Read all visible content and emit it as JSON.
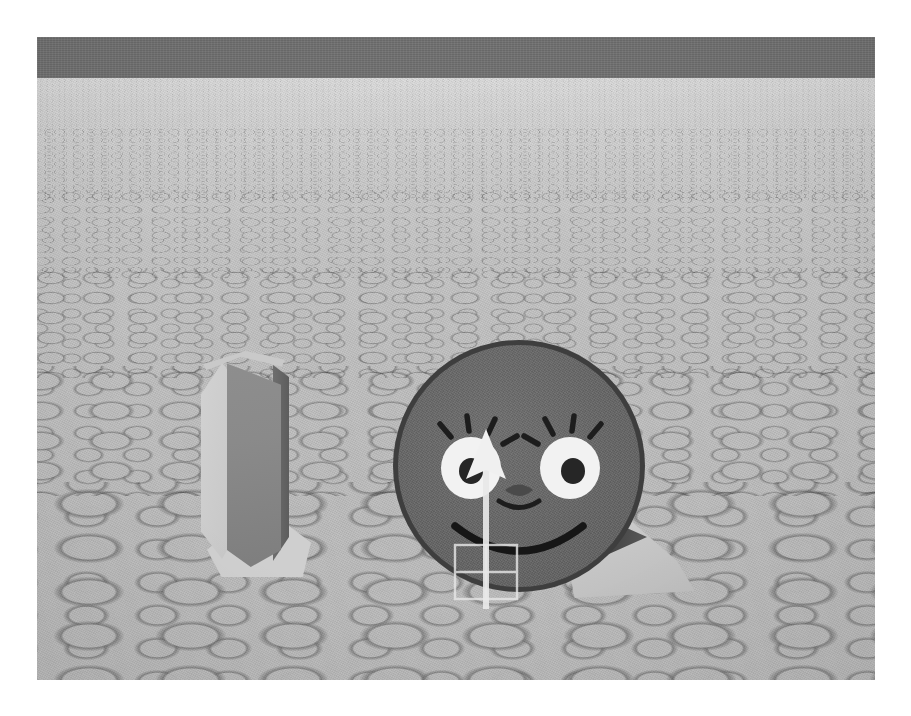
{
  "app": {
    "title": "Robot Simulator Viewport",
    "view_label": "3D Scene View"
  },
  "scene": {
    "name": "simulation-scene",
    "viewport": {
      "x": 37,
      "y": 37,
      "width": 838,
      "height": 643
    },
    "background_color": "#ffffff",
    "sky": {
      "label": "Sky",
      "color": "#717171",
      "height_px": 41
    },
    "ground": {
      "label": "Cobblestone Ground Plane",
      "texture": "cobblestone-pebbles",
      "base_color": "#c2c2c2",
      "stone_color": "#dcdcdc",
      "mortar_color": "#8a8a8a",
      "horizon_y": 41
    },
    "horizon": {
      "label": "Horizon Line",
      "y_px": 41
    }
  },
  "objects": [
    {
      "name": "panel-object",
      "label": "Upright Panel",
      "type": "box",
      "position": {
        "x": 146,
        "y": 290
      },
      "size": {
        "width": 140,
        "height": 250
      },
      "front_face_color": "#8a8a8a",
      "side_face_color": "#cbcbcb",
      "edge_color": "#5d5d5d",
      "base_color": "#cfcfcf"
    },
    {
      "name": "robot-face",
      "label": "Smiley Robot",
      "type": "disc",
      "position": {
        "x": 356,
        "y": 303
      },
      "size": {
        "width": 252,
        "height": 252
      },
      "body_color": "#666666",
      "rim_color": "#3e3e3e",
      "eye_color": "#f2f2f2",
      "pupil_color": "#262626",
      "feature_stroke_color": "#1d1d1d",
      "features": [
        "left-eye",
        "right-eye",
        "eyelashes",
        "nose",
        "smile"
      ]
    },
    {
      "name": "cone-marker-object",
      "label": "Cone with Direction Marker",
      "type": "cone",
      "position": {
        "x": 520,
        "y": 455
      },
      "size": {
        "width": 150,
        "height": 110
      },
      "cone_color": "#c6c6c6",
      "marker_color": "#4a4a4a",
      "marker_direction": "right"
    }
  ],
  "overlay": {
    "heading_arrow": {
      "name": "heading-arrow",
      "label": "Heading Arrow",
      "direction": "up",
      "color": "#f0f0f0",
      "shaft_color": "#e8e8e8"
    },
    "selection_box": {
      "name": "selection-box",
      "label": "Selection Bounding Box",
      "stroke_color": "#e6e6e6",
      "fill": "transparent"
    }
  }
}
